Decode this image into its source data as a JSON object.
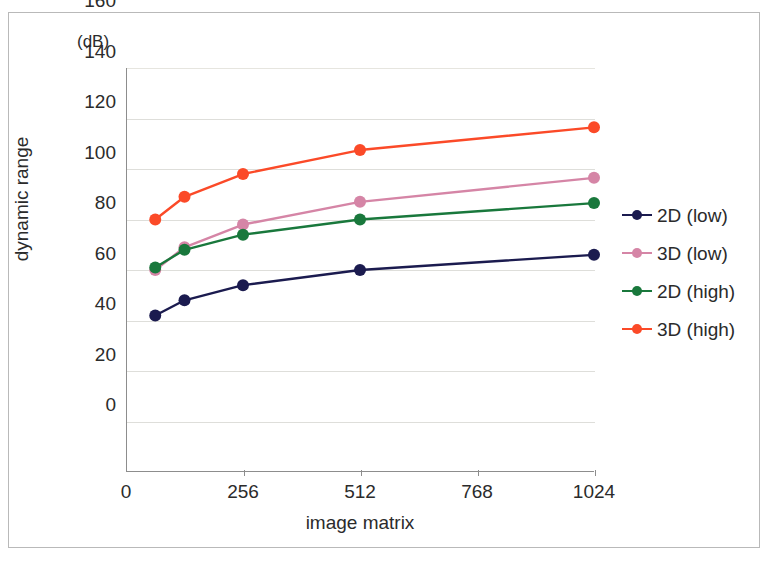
{
  "chart_data": {
    "type": "line",
    "title": "",
    "xlabel": "image matrix",
    "ylabel": "dynamic range",
    "unit_label": "(dB)",
    "x": [
      64,
      128,
      256,
      512,
      1024
    ],
    "xlim": [
      0,
      1024
    ],
    "ylim": [
      0,
      160
    ],
    "xticks": [
      "0",
      "256",
      "512",
      "768",
      "1024"
    ],
    "xtick_values": [
      0,
      256,
      512,
      768,
      1024
    ],
    "yticks": [
      "0",
      "20",
      "40",
      "60",
      "80",
      "100",
      "120",
      "140",
      "160"
    ],
    "ytick_values": [
      0,
      20,
      40,
      60,
      80,
      100,
      120,
      140,
      160
    ],
    "grid": "horizontal",
    "legend_position": "right",
    "series": [
      {
        "name": "2D (low)",
        "color": "#1b1b4f",
        "values": [
          62,
          68,
          74,
          80,
          86
        ]
      },
      {
        "name": "3D (low)",
        "color": "#d585a6",
        "values": [
          80,
          89,
          98,
          107,
          116.5
        ]
      },
      {
        "name": "2D (high)",
        "color": "#19783c",
        "values": [
          81,
          88,
          94,
          100,
          106.5
        ]
      },
      {
        "name": "3D (high)",
        "color": "#fb4a28",
        "values": [
          100,
          109,
          118,
          127.5,
          136.5
        ]
      }
    ]
  },
  "legend": {
    "items": [
      {
        "label": "2D (low)"
      },
      {
        "label": "3D (low)"
      },
      {
        "label": "2D (high)"
      },
      {
        "label": "3D (high)"
      }
    ]
  },
  "axes": {
    "y_title": "dynamic range",
    "x_title": "image matrix",
    "unit": "(dB)"
  }
}
